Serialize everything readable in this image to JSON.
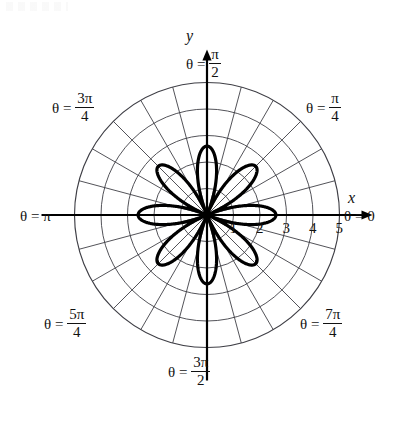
{
  "figure": {
    "kind": "polar-plot",
    "background_color": "#ffffff",
    "curve_color": "#000000",
    "grid_color": "#3f3f46",
    "axis_color": "#000000"
  },
  "axes": {
    "x_label": "x",
    "y_label": "y",
    "center_x": 207,
    "center_y": 215,
    "unit_px": 26.5,
    "outer_radius_units": 5
  },
  "radial_ticks": {
    "labels": [
      "1",
      "2",
      "3",
      "4",
      "5"
    ],
    "values": [
      1,
      2,
      3,
      4,
      5
    ]
  },
  "angle_labels": [
    {
      "name": "theta-0",
      "prefix": "θ =",
      "whole": "0",
      "num": "",
      "den": "",
      "degrees": 0
    },
    {
      "name": "theta-pi-4",
      "prefix": "θ =",
      "whole": "",
      "num": "π",
      "den": "4",
      "degrees": 45
    },
    {
      "name": "theta-pi-2",
      "prefix": "θ =",
      "whole": "",
      "num": "π",
      "den": "2",
      "degrees": 90
    },
    {
      "name": "theta-3pi-4",
      "prefix": "θ =",
      "whole": "",
      "num": "3π",
      "den": "4",
      "degrees": 135
    },
    {
      "name": "theta-pi",
      "prefix": "θ =",
      "whole": "π",
      "num": "",
      "den": "",
      "degrees": 180
    },
    {
      "name": "theta-5pi-4",
      "prefix": "θ =",
      "whole": "",
      "num": "5π",
      "den": "4",
      "degrees": 225
    },
    {
      "name": "theta-3pi-2",
      "prefix": "θ =",
      "whole": "",
      "num": "3π",
      "den": "2",
      "degrees": 270
    },
    {
      "name": "theta-7pi-4",
      "prefix": "θ =",
      "whole": "",
      "num": "7π",
      "den": "4",
      "degrees": 315
    }
  ],
  "chart_data": {
    "type": "line",
    "plot_kind": "polar-rose",
    "title": "",
    "xlabel": "x",
    "ylabel": "y",
    "equation": "r = 2.6 cos(4θ)",
    "amplitude": 2.6,
    "petal_frequency": 4,
    "petal_count": 8,
    "petal_tip_radius": 2.6,
    "petal_tip_angles_deg": [
      0,
      45,
      90,
      135,
      180,
      225,
      270,
      315
    ],
    "rlim": [
      0,
      5
    ],
    "r_ticks": [
      1,
      2,
      3,
      4,
      5
    ],
    "theta_gridlines_deg": [
      0,
      15,
      30,
      45,
      60,
      75,
      90,
      105,
      120,
      135,
      150,
      165,
      180,
      195,
      210,
      225,
      240,
      255,
      270,
      285,
      300,
      315,
      330,
      345
    ],
    "theta_tick_labels": [
      "0",
      "π/4",
      "π/2",
      "3π/4",
      "π",
      "5π/4",
      "3π/2",
      "7π/4"
    ],
    "grid": true,
    "legend": "none",
    "series": [
      {
        "name": "r = 2.6 cos(4θ)",
        "color": "#000000",
        "line_width": 3.2,
        "r_of_theta_deg": [
          2.6,
          2.5,
          2.25,
          1.84,
          1.3,
          0.67,
          0.0,
          0.67,
          1.3,
          1.84,
          2.25,
          2.5,
          2.6,
          2.5,
          2.25,
          1.84,
          1.3,
          0.67,
          0.0,
          0.67,
          1.3,
          1.84,
          2.25,
          2.5,
          2.6,
          2.5,
          2.25,
          1.84,
          1.3,
          0.67,
          0.0,
          0.67,
          1.3,
          1.84,
          2.25,
          2.5,
          2.6,
          2.5,
          2.25,
          1.84,
          1.3,
          0.67,
          0.0,
          0.67,
          1.3,
          1.84,
          2.25,
          2.5,
          2.6
        ],
        "theta_samples_deg": [
          0,
          7.5,
          15,
          22.5,
          30,
          37.5,
          45,
          52.5,
          60,
          67.5,
          75,
          82.5,
          90,
          97.5,
          105,
          112.5,
          120,
          127.5,
          135,
          142.5,
          150,
          157.5,
          165,
          172.5,
          180,
          187.5,
          195,
          202.5,
          210,
          217.5,
          225,
          232.5,
          240,
          247.5,
          255,
          262.5,
          270,
          277.5,
          285,
          292.5,
          300,
          307.5,
          315,
          322.5,
          330,
          337.5,
          345,
          352.5,
          360
        ]
      }
    ]
  }
}
